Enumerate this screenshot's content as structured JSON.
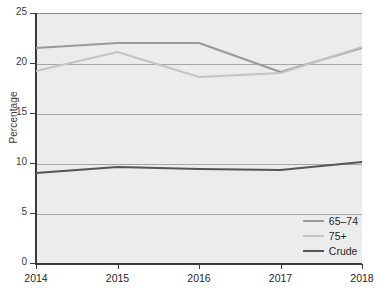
{
  "chart_data": {
    "type": "line",
    "title": "",
    "xlabel": "",
    "ylabel": "Percentage",
    "x": [
      2014,
      2015,
      2016,
      2017,
      2018
    ],
    "categories": [
      "2014",
      "2015",
      "2016",
      "2017",
      "2018"
    ],
    "xlim": [
      2014,
      2018
    ],
    "ylim": [
      0,
      25
    ],
    "yticks": [
      0,
      5,
      10,
      15,
      20,
      25
    ],
    "ytick_labels": [
      "0",
      "5",
      "10",
      "15",
      "20",
      "25"
    ],
    "xtick_labels": [
      "2014",
      "2015",
      "2016",
      "2017",
      "2018"
    ],
    "grid": "horizontal",
    "legend_position": "lower-right",
    "plot_background": "#ececec",
    "gridline_color": "#a6a6a6",
    "series": [
      {
        "name": "65-74",
        "label": "65–74",
        "color": "#999999",
        "width": 2.0,
        "values": [
          21.5,
          22.0,
          22.0,
          19.1,
          21.5
        ]
      },
      {
        "name": "75+",
        "label": "75+",
        "color": "#c4c4c4",
        "width": 2.0,
        "values": [
          19.2,
          21.1,
          18.6,
          19.0,
          21.6
        ]
      },
      {
        "name": "Crude",
        "label": "Crude",
        "color": "#555555",
        "width": 2.2,
        "values": [
          9.0,
          9.6,
          9.4,
          9.3,
          10.1
        ]
      }
    ]
  },
  "legend": {
    "items": [
      {
        "label": "65–74",
        "color": "#999999"
      },
      {
        "label": "75+",
        "color": "#c4c4c4"
      },
      {
        "label": "Crude",
        "color": "#555555"
      }
    ]
  },
  "axes": {
    "y_title": "Percentage"
  }
}
